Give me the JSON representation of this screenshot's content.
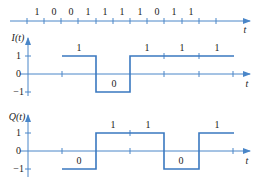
{
  "colors": {
    "axis": "#4a86c8",
    "signal": "#3a78c0",
    "text": "#222222",
    "background": "#ffffff"
  },
  "bit_stream": {
    "bits": [
      "1",
      "0",
      "0",
      "1",
      "1",
      "1",
      "1",
      "0",
      "1",
      "1"
    ],
    "axis_label": "t"
  },
  "i_panel": {
    "y_label": "I(t)",
    "y_ticks": [
      "1",
      "0",
      "−1"
    ],
    "x_label": "t",
    "symbol_labels": [
      "1",
      "0",
      "1",
      "1",
      "1"
    ],
    "levels": [
      1,
      -1,
      1,
      1,
      1
    ]
  },
  "q_panel": {
    "y_label": "Q(t)",
    "y_ticks": [
      "1",
      "0",
      "−1"
    ],
    "x_label": "t",
    "symbol_labels": [
      "0",
      "1",
      "1",
      "0",
      "1"
    ],
    "levels": [
      -1,
      1,
      1,
      -1,
      1
    ]
  }
}
